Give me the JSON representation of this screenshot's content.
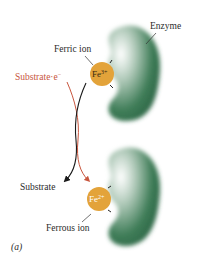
{
  "diagram": {
    "panel_label": "(a)",
    "labels": {
      "enzyme": "Enzyme",
      "ferric_ion": "Ferric ion",
      "substrate_reduced": "Substrate·e",
      "substrate_reduced_sup": "−",
      "substrate": "Substrate",
      "ferrous_ion": "Ferrous ion"
    },
    "ions": {
      "top": {
        "symbol": "Fe",
        "charge": "3+"
      },
      "bottom": {
        "symbol": "Fe",
        "charge": "2+"
      }
    },
    "colors": {
      "enzyme_green": "#2e6b47",
      "ion_orange": "#e3a33a",
      "arrow_red": "#c8553d",
      "arrow_black": "#1a1a1a",
      "text": "#2b2b2b"
    }
  }
}
